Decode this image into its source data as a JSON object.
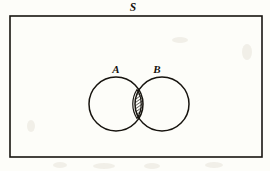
{
  "figure": {
    "kind": "venn-diagram",
    "background_color": "#fdfdf9",
    "ink_color": "#17140f",
    "width": 270,
    "height": 171
  },
  "universe": {
    "label": "S",
    "label_x": 133,
    "label_y": 11,
    "rect": {
      "x": 10,
      "y": 16,
      "width": 252,
      "height": 141
    }
  },
  "sets": [
    {
      "label": "A",
      "label_x": 116,
      "label_y": 73,
      "cx": 116,
      "cy": 104,
      "r": 27
    },
    {
      "label": "B",
      "label_x": 157,
      "label_y": 73,
      "cx": 162,
      "cy": 104,
      "r": 27
    }
  ],
  "intersection": {
    "name": "A-intersect-B",
    "shaded": true,
    "fill_pattern": "diagonal-hatch",
    "hatch_color": "#17140f",
    "hatch_spacing": 2,
    "top_x": 137,
    "top_y": 89.5,
    "bottom_x": 137,
    "bottom_y": 118.5,
    "half_width": 4.6
  },
  "accessibility": {
    "description": "Rectangle labeled S containing two overlapping circles labeled A and B; the lens-shaped overlap region is shaded with diagonal hatching."
  }
}
